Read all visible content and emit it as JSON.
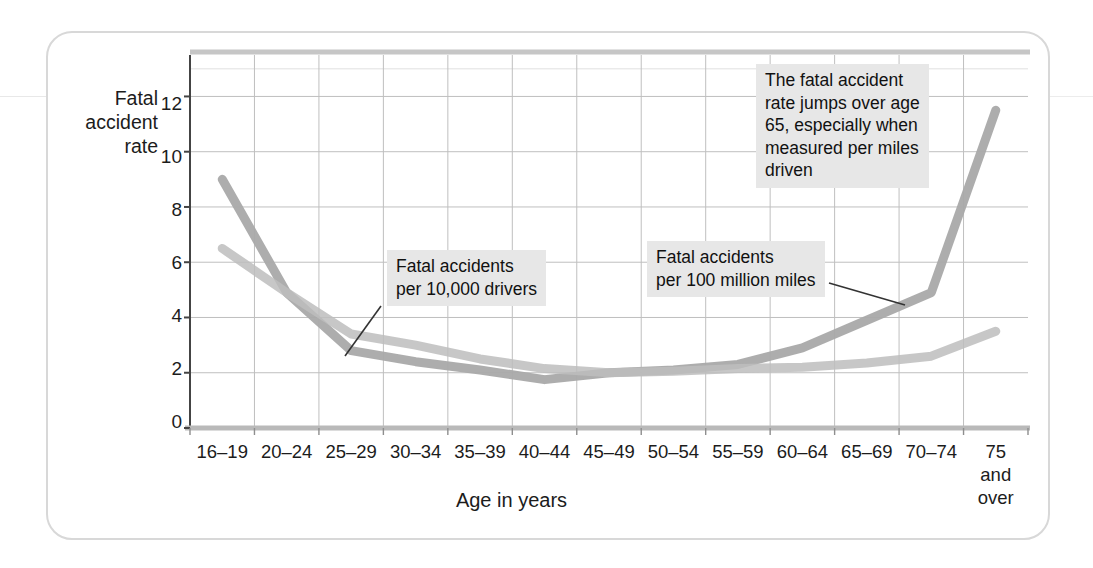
{
  "figure": {
    "background_color": "#ffffff",
    "border_color": "#d8d8d8"
  },
  "axes": {
    "y_axis_title": "Fatal\naccident\nrate",
    "y_axis_title_lines": [
      "Fatal",
      "accident",
      "rate"
    ],
    "x_axis_title": "Age in years",
    "y_ticks": [
      "12",
      "10",
      "8",
      "6",
      "4",
      "2",
      "0"
    ],
    "x_ticks": [
      "16–19",
      "20–24",
      "25–29",
      "30–34",
      "35–39",
      "40–44",
      "45–49",
      "50–54",
      "55–59",
      "60–64",
      "65–69",
      "70–74",
      "75\nand\nover"
    ],
    "x_last_tick_lines": [
      "75",
      "and",
      "over"
    ]
  },
  "annotations": [
    {
      "id": "drivers-callout",
      "text": "Fatal accidents\nper 10,000 drivers"
    },
    {
      "id": "miles-callout",
      "text": "Fatal accidents\nper 100 million miles"
    },
    {
      "id": "jump-callout",
      "text": "The fatal accident\nrate jumps over age\n65, especially when\nmeasured per miles\ndriven"
    }
  ],
  "chart_data": {
    "type": "line",
    "title": "",
    "xlabel": "Age in years",
    "ylabel": "Fatal accident rate",
    "ylim": [
      0,
      13.5
    ],
    "grid": true,
    "legend": "annotated-inline",
    "categories": [
      "16–19",
      "20–24",
      "25–29",
      "30–34",
      "35–39",
      "40–44",
      "45–49",
      "50–54",
      "55–59",
      "60–64",
      "65–69",
      "70–74",
      "75 and over"
    ],
    "series": [
      {
        "name": "Fatal accidents per 100 million miles",
        "color": "#a9a9a9",
        "values": [
          9.0,
          4.9,
          2.8,
          2.4,
          2.1,
          1.75,
          2.0,
          2.1,
          2.3,
          2.9,
          3.9,
          4.9,
          11.5
        ]
      },
      {
        "name": "Fatal accidents per 10,000 drivers",
        "color": "#bdbdbd",
        "values": [
          6.5,
          4.9,
          3.4,
          3.0,
          2.5,
          2.15,
          2.0,
          2.05,
          2.15,
          2.2,
          2.35,
          2.6,
          3.5
        ]
      }
    ],
    "ytick_values": [
      12,
      10,
      8,
      6,
      4,
      2,
      0
    ]
  },
  "colors": {
    "grid": "#bfbfbf",
    "axis": "#555555",
    "series_dark": "#a9a9a9",
    "series_light": "#bdbdbd",
    "callout_bg": "#e7e7e7",
    "text": "#1c1c1c"
  }
}
